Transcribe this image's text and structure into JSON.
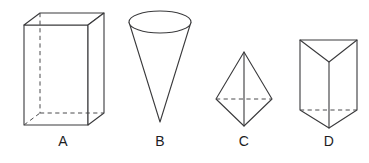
{
  "figure": {
    "background_color": "#ffffff",
    "stroke_color": "#3a3a3c",
    "hidden_stroke_color": "#4a4a4c",
    "label_color": "#1d1d1f",
    "width": 369,
    "height": 163
  },
  "shapes": [
    {
      "id": "A",
      "label": "A",
      "name": "rectangular-prism",
      "description": "Rectangular prism (cuboid) drawn in oblique projection with dashed hidden back edges",
      "front_face": {
        "left": 24,
        "top": 25,
        "right": 88,
        "bottom": 125
      },
      "depth_offset": {
        "dx": 16,
        "dy": -12
      },
      "hidden_edges": [
        "back-left-vertical",
        "back-bottom-left",
        "back-bottom-right"
      ],
      "label_position": {
        "x": 63,
        "y": 136
      }
    },
    {
      "id": "B",
      "label": "B",
      "name": "cone",
      "description": "Inverted cone with elliptical top opening and apex pointing down",
      "ellipse": {
        "cx": 160,
        "cy": 22,
        "rx": 31,
        "ry": 11
      },
      "apex": {
        "x": 160,
        "y": 122
      },
      "label_position": {
        "x": 160,
        "y": 136
      }
    },
    {
      "id": "C",
      "label": "C",
      "name": "bipyramid",
      "description": "Square bipyramid (double pyramid) with dashed hidden base diagonal and solid vertical center edge",
      "apex_top": {
        "x": 244,
        "y": 52
      },
      "apex_bottom": {
        "x": 244,
        "y": 126
      },
      "left_vertex": {
        "x": 216,
        "y": 99
      },
      "right_vertex": {
        "x": 272,
        "y": 99
      },
      "hidden_edges": [
        "base-horizontal-diagonal"
      ],
      "label_position": {
        "x": 244,
        "y": 136
      }
    },
    {
      "id": "D",
      "label": "D",
      "name": "triangular-prism",
      "description": "Upright triangular prism showing top triangular face as a V and dashed hidden bottom edge",
      "top_left": {
        "x": 300,
        "y": 40
      },
      "top_right": {
        "x": 357,
        "y": 40
      },
      "top_front_vertex": {
        "x": 329,
        "y": 62
      },
      "bottom_left": {
        "x": 300,
        "y": 110
      },
      "bottom_right": {
        "x": 357,
        "y": 110
      },
      "bottom_front_vertex": {
        "x": 329,
        "y": 128
      },
      "hidden_edges": [
        "bottom-back-horizontal"
      ],
      "label_position": {
        "x": 329,
        "y": 136
      }
    }
  ]
}
